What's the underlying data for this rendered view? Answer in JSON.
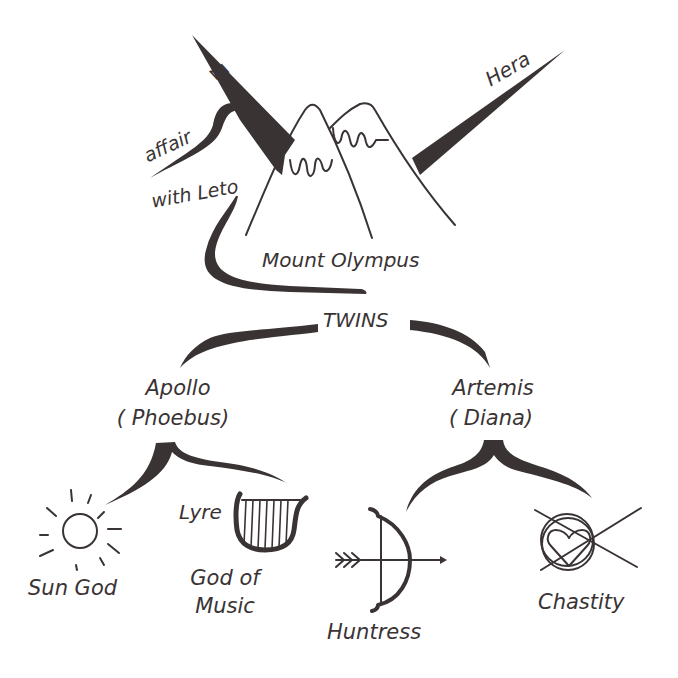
{
  "diagram": {
    "colors": {
      "ink": "#3a3334",
      "background": "#ffffff"
    },
    "nodes": {
      "zeus": {
        "label": "Zeus"
      },
      "hera": {
        "label": "Hera"
      },
      "affair": {
        "line1": "affair",
        "line2": "with Leto"
      },
      "mount_olympus": {
        "label": "Mount Olympus",
        "icon": "mountains-icon"
      },
      "twins": {
        "label": "TWINS"
      },
      "apollo": {
        "name": "Apollo",
        "alias": "( Phoebus)"
      },
      "artemis": {
        "name": "Artemis",
        "alias": "( Diana)"
      },
      "sun_god": {
        "label": "Sun God",
        "icon": "sun-icon"
      },
      "lyre": {
        "label": "Lyre",
        "icon": "lyre-icon"
      },
      "god_of_music": {
        "line1": "God of",
        "line2": "Music"
      },
      "huntress": {
        "label": "Huntress",
        "icon": "bow-and-arrow-icon"
      },
      "chastity": {
        "label": "Chastity",
        "icon": "crossed-heart-icon"
      }
    },
    "edges": [
      {
        "from": "zeus",
        "to": "mount_olympus"
      },
      {
        "from": "hera",
        "to": "mount_olympus"
      },
      {
        "from": "zeus",
        "to": "affair"
      },
      {
        "from": "affair",
        "to": "twins"
      },
      {
        "from": "twins",
        "to": "apollo"
      },
      {
        "from": "twins",
        "to": "artemis"
      },
      {
        "from": "apollo",
        "to": "sun_god"
      },
      {
        "from": "apollo",
        "to": "lyre"
      },
      {
        "from": "artemis",
        "to": "huntress"
      },
      {
        "from": "artemis",
        "to": "chastity"
      }
    ]
  }
}
